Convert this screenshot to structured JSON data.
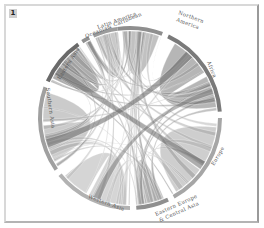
{
  "figure": {
    "panel_label": "1",
    "type": "chord diagram",
    "center": [
      130,
      118
    ],
    "radius": 88
  },
  "regions": [
    {
      "id": "northern-america",
      "label": "Northern America",
      "start": -8,
      "end": 21,
      "color": "#8e8e8e"
    },
    {
      "id": "africa",
      "label": "Africa",
      "start": 25,
      "end": 86,
      "color": "#7a7a7a"
    },
    {
      "id": "europe",
      "label": "Europe",
      "start": 90,
      "end": 151,
      "color": "#a6a6a6"
    },
    {
      "id": "eastern-europe-central-asia",
      "label": "Eastern Europe & Central Asia",
      "start": 155,
      "end": 176,
      "color": "#8f8f8f"
    },
    {
      "id": "western-asia",
      "label": "Western Asia",
      "start": 180,
      "end": 231,
      "color": "#b2b2b2"
    },
    {
      "id": "southern-asia",
      "label": "Southern Asia",
      "start": 235,
      "end": 290,
      "color": "#a0a0a0"
    },
    {
      "id": "eastern-asia",
      "label": "Eastern Asia",
      "start": 294,
      "end": 325,
      "color": "#6a6a6a"
    },
    {
      "id": "oceania",
      "label": "Oceania",
      "start": 328,
      "end": 333,
      "color": "#909090"
    },
    {
      "id": "latin-america-caribbean",
      "label": "Latin America & Caribbean",
      "start": 336,
      "end": 352,
      "color": "#9c9c9c"
    }
  ],
  "labels": {
    "northern_america_1": "Northern",
    "northern_america_2": "America",
    "africa": "Africa",
    "europe": "Europe",
    "eeca_1": "Eastern Europe",
    "eeca_2": "& Central Asia",
    "western_asia": "Western Asia",
    "southern_asia": "Southern Asia",
    "eastern_asia": "Eastern Asia",
    "latin_1": "Latin America",
    "latin_2": "Oceania& Caribbean"
  }
}
